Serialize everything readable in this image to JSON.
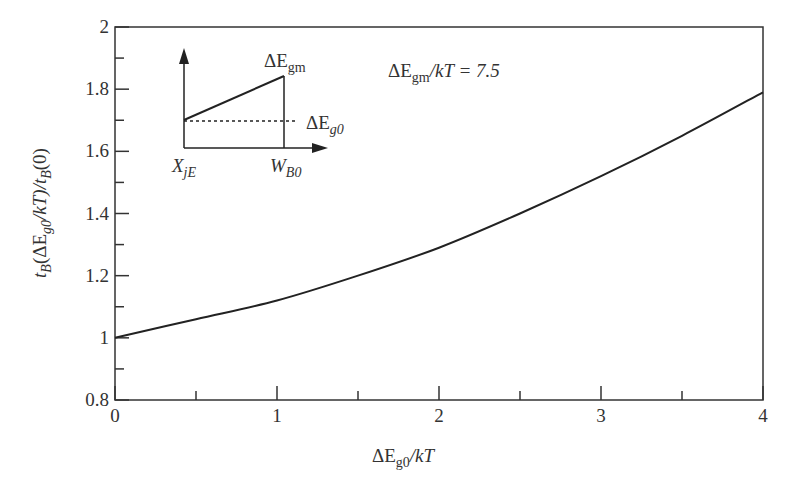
{
  "chart_data": {
    "type": "line",
    "title": "",
    "xlabel": "ΔE_g0/kT",
    "ylabel": "t_B(ΔE_g0/kT)/t_B(0)",
    "xlim": [
      0,
      4
    ],
    "ylim": [
      0.8,
      2
    ],
    "grid": false,
    "x_ticks": [
      "0",
      "1",
      "2",
      "3",
      "4"
    ],
    "y_ticks": [
      "0.8",
      "1",
      "1.2",
      "1.4",
      "1.6",
      "1.8",
      "2"
    ],
    "annotation": "ΔE_gm/kT = 7.5",
    "series": [
      {
        "name": "t_B ratio",
        "x": [
          0,
          0.5,
          1,
          1.5,
          2,
          2.5,
          3,
          3.5,
          4
        ],
        "y": [
          1.0,
          1.06,
          1.12,
          1.2,
          1.29,
          1.4,
          1.52,
          1.65,
          1.79
        ]
      }
    ],
    "inset": {
      "description": "Bandgap profile schematic",
      "labels": {
        "top": "ΔE_gm",
        "dotted": "ΔE_g0",
        "x_left": "X_jE",
        "x_right": "W_B0"
      }
    }
  },
  "labels": {
    "xlabel_main": "ΔE",
    "xlabel_sub": "g0",
    "xlabel_tail": "/kT",
    "ylabel_t": "t",
    "ylabel_B": "B",
    "ylabel_open": "(ΔE",
    "ylabel_g0": "g0",
    "ylabel_mid": "/kT)/t",
    "ylabel_B2": "B",
    "ylabel_end": "(0)",
    "annot_main": "ΔE",
    "annot_sub": "gm",
    "annot_tail": "/kT = 7.5",
    "inset_gm_main": "ΔE",
    "inset_gm_sub": "gm",
    "inset_g0_main": "ΔE",
    "inset_g0_sub": "g0",
    "inset_x_main": "X",
    "inset_x_sub": "jE",
    "inset_w_main": "W",
    "inset_w_sub": "B0"
  },
  "colors": {
    "line": "#222222",
    "axis": "#333333"
  }
}
